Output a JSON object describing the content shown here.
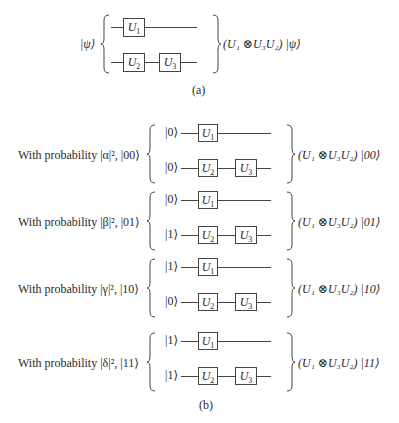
{
  "part_a": {
    "input_state": "|ψ⟩",
    "top_gates": [
      {
        "label": "U",
        "sub": "1"
      }
    ],
    "bottom_gates": [
      {
        "label": "U",
        "sub": "2"
      },
      {
        "label": "U",
        "sub": "3"
      }
    ],
    "output": "(U₁ ⊗U₃U₂) |ψ⟩",
    "caption": "(a)"
  },
  "part_b": {
    "caption": "(b)",
    "cases": [
      {
        "prob_text": "With probability |α|², |00⟩",
        "top_input": "|0⟩",
        "bottom_input": "|0⟩",
        "output": "(U₁ ⊗U₃U₂) |00⟩"
      },
      {
        "prob_text": "With probability |β|², |01⟩",
        "top_input": "|0⟩",
        "bottom_input": "|1⟩",
        "output": "(U₁ ⊗U₃U₂) |01⟩"
      },
      {
        "prob_text": "With probability |γ|², |10⟩",
        "top_input": "|1⟩",
        "bottom_input": "|0⟩",
        "output": "(U₁ ⊗U₃U₂) |10⟩"
      },
      {
        "prob_text": "With probability |δ|², |11⟩",
        "top_input": "|1⟩",
        "bottom_input": "|1⟩",
        "output": "(U₁ ⊗U₃U₂) |11⟩"
      }
    ],
    "gates": {
      "g1": "U",
      "g1_sub": "1",
      "g2": "U",
      "g2_sub": "2",
      "g3": "U",
      "g3_sub": "3"
    }
  }
}
